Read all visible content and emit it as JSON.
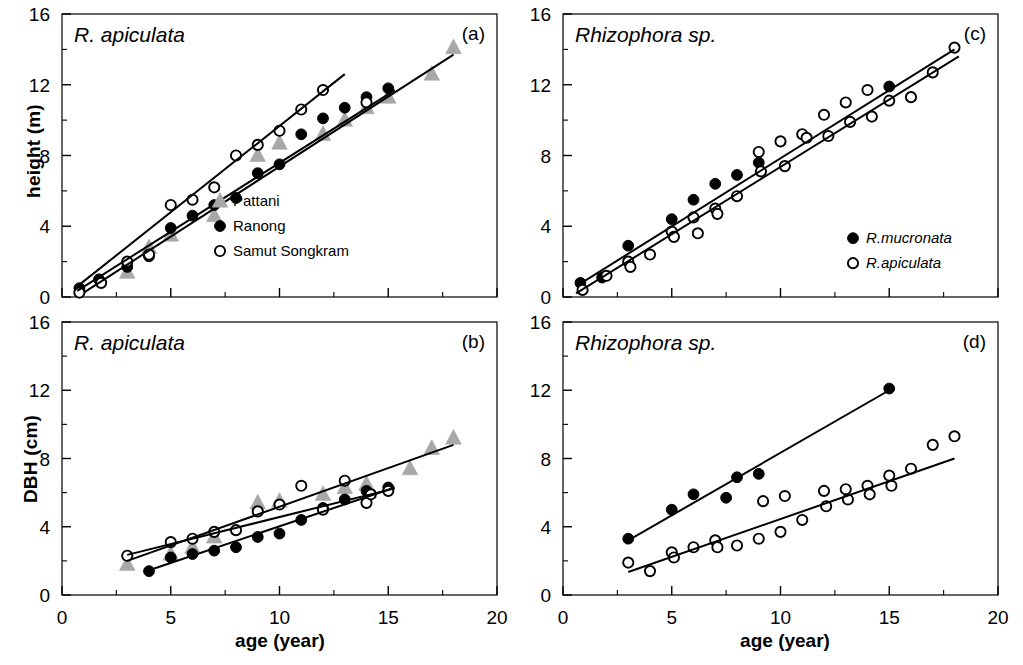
{
  "figure": {
    "width": 1023,
    "height": 665,
    "background": "#ffffff",
    "ink": "#000000",
    "gray": "#a8a8a8"
  },
  "axes": {
    "x_label": "age (year)",
    "x_ticks": [
      "0",
      "5",
      "10",
      "15",
      "20"
    ],
    "x_tick_values": [
      0,
      5,
      10,
      15,
      20
    ],
    "x_minor_values": [
      2.5,
      7.5,
      12.5,
      17.5
    ],
    "xlim": [
      0,
      20
    ],
    "y_ticks": [
      "0",
      "4",
      "8",
      "12",
      "16"
    ],
    "y_tick_values": [
      0,
      4,
      8,
      12,
      16
    ],
    "y_minor_values": [
      2,
      6,
      10,
      14
    ],
    "ylim": [
      0,
      16
    ],
    "y_label_height": "height (m)",
    "y_label_dbh": "DBH (cm)"
  },
  "chart_data": [
    {
      "id": "panel-a",
      "type": "scatter",
      "tag": "(a)",
      "title": "R. apiculata",
      "xlabel": "age (year)",
      "ylabel": "height (m)",
      "xlim": [
        0,
        20
      ],
      "ylim": [
        0,
        16
      ],
      "grid": false,
      "legend_position": "bottom-right",
      "series": [
        {
          "name": "Pattani",
          "marker": "triangle",
          "fill": "#a8a8a8",
          "points": [
            {
              "x": 3.0,
              "y": 1.4
            },
            {
              "x": 4.0,
              "y": 2.8
            },
            {
              "x": 5.0,
              "y": 3.5
            },
            {
              "x": 7.0,
              "y": 4.6
            },
            {
              "x": 9.0,
              "y": 8.0
            },
            {
              "x": 10.0,
              "y": 8.7
            },
            {
              "x": 12.0,
              "y": 9.2
            },
            {
              "x": 13.0,
              "y": 10.0
            },
            {
              "x": 14.0,
              "y": 10.7
            },
            {
              "x": 15.0,
              "y": 11.3
            },
            {
              "x": 17.0,
              "y": 12.6
            },
            {
              "x": 18.0,
              "y": 14.1
            }
          ],
          "fit_line": {
            "x0": 1.0,
            "y0": 0.25,
            "x1": 18.0,
            "y1": 13.7
          }
        },
        {
          "name": "Ranong",
          "marker": "circle-filled",
          "fill": "#000000",
          "points": [
            {
              "x": 0.8,
              "y": 0.5
            },
            {
              "x": 1.7,
              "y": 1.0
            },
            {
              "x": 3.0,
              "y": 1.7
            },
            {
              "x": 4.0,
              "y": 2.3
            },
            {
              "x": 5.0,
              "y": 3.9
            },
            {
              "x": 6.0,
              "y": 4.6
            },
            {
              "x": 7.0,
              "y": 5.2
            },
            {
              "x": 8.0,
              "y": 5.6
            },
            {
              "x": 9.0,
              "y": 7.0
            },
            {
              "x": 10.0,
              "y": 7.5
            },
            {
              "x": 11.0,
              "y": 9.2
            },
            {
              "x": 12.0,
              "y": 10.1
            },
            {
              "x": 13.0,
              "y": 10.7
            },
            {
              "x": 14.0,
              "y": 11.3
            },
            {
              "x": 15.0,
              "y": 11.8
            }
          ],
          "fit_line": {
            "x0": 0.7,
            "y0": 0.35,
            "x1": 15.3,
            "y1": 11.7
          }
        },
        {
          "name": "Samut Songkram",
          "marker": "circle-open",
          "fill": "#ffffff",
          "points": [
            {
              "x": 0.8,
              "y": 0.25
            },
            {
              "x": 1.8,
              "y": 0.8
            },
            {
              "x": 3.0,
              "y": 2.0
            },
            {
              "x": 4.0,
              "y": 2.4
            },
            {
              "x": 5.0,
              "y": 5.2
            },
            {
              "x": 6.0,
              "y": 5.5
            },
            {
              "x": 7.0,
              "y": 6.2
            },
            {
              "x": 8.0,
              "y": 8.0
            },
            {
              "x": 9.0,
              "y": 8.6
            },
            {
              "x": 10.0,
              "y": 9.4
            },
            {
              "x": 11.0,
              "y": 10.6
            },
            {
              "x": 12.0,
              "y": 11.7
            },
            {
              "x": 14.0,
              "y": 11.0
            }
          ],
          "fit_line": {
            "x0": 0.6,
            "y0": 0.5,
            "x1": 13.0,
            "y1": 12.6
          }
        }
      ]
    },
    {
      "id": "panel-b",
      "type": "scatter",
      "tag": "(b)",
      "title": "R. apiculata",
      "xlabel": "age (year)",
      "ylabel": "DBH (cm)",
      "xlim": [
        0,
        20
      ],
      "ylim": [
        0,
        16
      ],
      "grid": false,
      "legend_position": "none",
      "series": [
        {
          "name": "Pattani",
          "marker": "triangle",
          "fill": "#a8a8a8",
          "points": [
            {
              "x": 3.0,
              "y": 1.8
            },
            {
              "x": 5.0,
              "y": 2.4
            },
            {
              "x": 6.0,
              "y": 2.8
            },
            {
              "x": 7.0,
              "y": 3.4
            },
            {
              "x": 9.0,
              "y": 5.4
            },
            {
              "x": 10.0,
              "y": 5.5
            },
            {
              "x": 12.0,
              "y": 5.9
            },
            {
              "x": 13.0,
              "y": 6.3
            },
            {
              "x": 14.0,
              "y": 6.5
            },
            {
              "x": 16.0,
              "y": 7.4
            },
            {
              "x": 17.0,
              "y": 8.6
            },
            {
              "x": 18.0,
              "y": 9.2
            }
          ],
          "fit_line": {
            "x0": 3.0,
            "y0": 2.0,
            "x1": 18.0,
            "y1": 8.8
          }
        },
        {
          "name": "Ranong",
          "marker": "circle-filled",
          "fill": "#000000",
          "points": [
            {
              "x": 4.0,
              "y": 1.4
            },
            {
              "x": 5.0,
              "y": 2.2
            },
            {
              "x": 6.0,
              "y": 2.4
            },
            {
              "x": 7.0,
              "y": 2.6
            },
            {
              "x": 8.0,
              "y": 2.8
            },
            {
              "x": 9.0,
              "y": 3.4
            },
            {
              "x": 10.0,
              "y": 3.6
            },
            {
              "x": 11.0,
              "y": 4.4
            },
            {
              "x": 12.0,
              "y": 5.1
            },
            {
              "x": 13.0,
              "y": 5.6
            },
            {
              "x": 14.0,
              "y": 6.1
            },
            {
              "x": 15.0,
              "y": 6.3
            }
          ],
          "fit_line": {
            "x0": 4.0,
            "y0": 1.45,
            "x1": 15.3,
            "y1": 6.3
          }
        },
        {
          "name": "Samut Songkram",
          "marker": "circle-open",
          "fill": "#ffffff",
          "points": [
            {
              "x": 3.0,
              "y": 2.3
            },
            {
              "x": 5.0,
              "y": 3.1
            },
            {
              "x": 6.0,
              "y": 3.3
            },
            {
              "x": 7.0,
              "y": 3.7
            },
            {
              "x": 8.0,
              "y": 3.8
            },
            {
              "x": 9.0,
              "y": 4.9
            },
            {
              "x": 10.0,
              "y": 5.3
            },
            {
              "x": 11.0,
              "y": 6.4
            },
            {
              "x": 12.0,
              "y": 5.0
            },
            {
              "x": 13.0,
              "y": 6.7
            },
            {
              "x": 14.0,
              "y": 5.4
            },
            {
              "x": 14.2,
              "y": 5.9
            },
            {
              "x": 15.0,
              "y": 6.1
            }
          ],
          "fit_line": {
            "x0": 3.0,
            "y0": 2.35,
            "x1": 15.3,
            "y1": 6.25
          }
        }
      ]
    },
    {
      "id": "panel-c",
      "type": "scatter",
      "tag": "(c)",
      "title": "Rhizophora sp.",
      "xlabel": "age (year)",
      "ylabel": "height (m)",
      "xlim": [
        0,
        20
      ],
      "ylim": [
        0,
        16
      ],
      "grid": false,
      "legend_position": "bottom-right",
      "series": [
        {
          "name": "R.mucronata",
          "marker": "circle-filled",
          "fill": "#000000",
          "points": [
            {
              "x": 0.8,
              "y": 0.8
            },
            {
              "x": 1.8,
              "y": 1.1
            },
            {
              "x": 3.0,
              "y": 2.9
            },
            {
              "x": 5.0,
              "y": 4.4
            },
            {
              "x": 6.0,
              "y": 5.5
            },
            {
              "x": 7.0,
              "y": 6.4
            },
            {
              "x": 8.0,
              "y": 6.9
            },
            {
              "x": 9.0,
              "y": 7.6
            },
            {
              "x": 15.0,
              "y": 11.9
            }
          ],
          "fit_line": {
            "x0": 0.6,
            "y0": 0.6,
            "x1": 18.0,
            "y1": 14.0
          }
        },
        {
          "name": "R.apiculata",
          "marker": "circle-open",
          "fill": "#ffffff",
          "points": [
            {
              "x": 0.9,
              "y": 0.4
            },
            {
              "x": 2.0,
              "y": 1.2
            },
            {
              "x": 3.0,
              "y": 2.0
            },
            {
              "x": 3.1,
              "y": 1.7
            },
            {
              "x": 4.0,
              "y": 2.4
            },
            {
              "x": 5.0,
              "y": 3.7
            },
            {
              "x": 5.1,
              "y": 3.4
            },
            {
              "x": 6.0,
              "y": 4.5
            },
            {
              "x": 6.2,
              "y": 3.6
            },
            {
              "x": 7.0,
              "y": 5.0
            },
            {
              "x": 7.1,
              "y": 4.7
            },
            {
              "x": 8.0,
              "y": 5.7
            },
            {
              "x": 9.0,
              "y": 8.2
            },
            {
              "x": 9.1,
              "y": 7.1
            },
            {
              "x": 10.0,
              "y": 8.8
            },
            {
              "x": 10.2,
              "y": 7.4
            },
            {
              "x": 11.0,
              "y": 9.2
            },
            {
              "x": 11.2,
              "y": 9.0
            },
            {
              "x": 12.0,
              "y": 10.3
            },
            {
              "x": 12.2,
              "y": 9.1
            },
            {
              "x": 13.0,
              "y": 11.0
            },
            {
              "x": 13.2,
              "y": 9.9
            },
            {
              "x": 14.0,
              "y": 11.7
            },
            {
              "x": 14.2,
              "y": 10.2
            },
            {
              "x": 15.0,
              "y": 11.1
            },
            {
              "x": 16.0,
              "y": 11.3
            },
            {
              "x": 17.0,
              "y": 12.7
            },
            {
              "x": 18.0,
              "y": 14.1
            }
          ],
          "fit_line": {
            "x0": 0.6,
            "y0": 0.2,
            "x1": 18.2,
            "y1": 13.6
          }
        }
      ]
    },
    {
      "id": "panel-d",
      "type": "scatter",
      "tag": "(d)",
      "title": "Rhizophora sp.",
      "xlabel": "age (year)",
      "ylabel": "DBH (cm)",
      "xlim": [
        0,
        20
      ],
      "ylim": [
        0,
        16
      ],
      "grid": false,
      "legend_position": "none",
      "series": [
        {
          "name": "R.mucronata",
          "marker": "circle-filled",
          "fill": "#000000",
          "points": [
            {
              "x": 3.0,
              "y": 3.3
            },
            {
              "x": 5.0,
              "y": 5.0
            },
            {
              "x": 6.0,
              "y": 5.9
            },
            {
              "x": 7.5,
              "y": 5.7
            },
            {
              "x": 8.0,
              "y": 6.9
            },
            {
              "x": 9.0,
              "y": 7.1
            },
            {
              "x": 15.0,
              "y": 12.1
            }
          ],
          "fit_line": {
            "x0": 3.0,
            "y0": 3.2,
            "x1": 15.0,
            "y1": 12.0
          }
        },
        {
          "name": "R.apiculata",
          "marker": "circle-open",
          "fill": "#ffffff",
          "points": [
            {
              "x": 3.0,
              "y": 1.9
            },
            {
              "x": 4.0,
              "y": 1.4
            },
            {
              "x": 5.0,
              "y": 2.5
            },
            {
              "x": 5.1,
              "y": 2.2
            },
            {
              "x": 6.0,
              "y": 2.8
            },
            {
              "x": 7.0,
              "y": 3.2
            },
            {
              "x": 7.1,
              "y": 2.8
            },
            {
              "x": 8.0,
              "y": 2.9
            },
            {
              "x": 9.0,
              "y": 3.3
            },
            {
              "x": 9.2,
              "y": 5.5
            },
            {
              "x": 10.0,
              "y": 3.7
            },
            {
              "x": 10.2,
              "y": 5.8
            },
            {
              "x": 11.0,
              "y": 4.4
            },
            {
              "x": 12.0,
              "y": 6.1
            },
            {
              "x": 12.1,
              "y": 5.2
            },
            {
              "x": 13.0,
              "y": 6.2
            },
            {
              "x": 13.1,
              "y": 5.6
            },
            {
              "x": 14.0,
              "y": 6.4
            },
            {
              "x": 14.1,
              "y": 5.9
            },
            {
              "x": 15.0,
              "y": 7.0
            },
            {
              "x": 15.1,
              "y": 6.4
            },
            {
              "x": 16.0,
              "y": 7.4
            },
            {
              "x": 17.0,
              "y": 8.8
            },
            {
              "x": 18.0,
              "y": 9.3
            }
          ],
          "fit_line": {
            "x0": 3.0,
            "y0": 1.35,
            "x1": 18.0,
            "y1": 8.0
          }
        }
      ]
    }
  ],
  "legends": {
    "panel_a": [
      {
        "label": "Pattani",
        "marker": "triangle"
      },
      {
        "label": "Ranong",
        "marker": "circle-filled"
      },
      {
        "label": "Samut Songkram",
        "marker": "circle-open"
      }
    ],
    "panel_c": [
      {
        "label": "R.mucronata",
        "marker": "circle-filled"
      },
      {
        "label": "R.apiculata",
        "marker": "circle-open"
      }
    ]
  }
}
